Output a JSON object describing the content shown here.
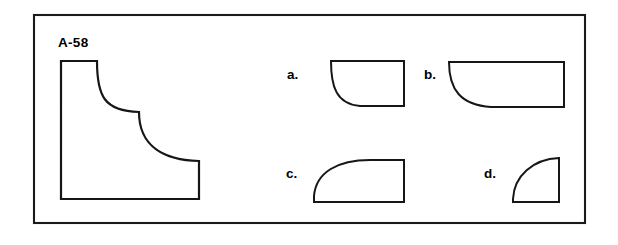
{
  "figure": {
    "id_label": "A-58",
    "frame": {
      "x": 34,
      "y": 15,
      "width": 551,
      "height": 208,
      "stroke_color": "#1a1a1a",
      "fill_color": "#ffffff"
    },
    "background_color": "#ffffff",
    "line_color": "#161616"
  },
  "main_shape": {
    "name": "stepped-concave-profile",
    "description": "Two-step profile with two concave quarter-arcs descending left to right",
    "bounds": {
      "x": 60,
      "y": 60,
      "width": 140,
      "height": 140
    },
    "path": "M 61 61 L 97 61 C 97 96 104 111 139 112 L 139 112 L 139 112 C 139 147 165 160 199 161 L 199 199 L 61 199 Z"
  },
  "options": [
    {
      "key": "a",
      "label": "a.",
      "label_x": 287,
      "label_y": 79,
      "shape_name": "option-a-concave-lower-left",
      "bounds": {
        "x": 331,
        "y": 61,
        "width": 74,
        "height": 46
      },
      "path": "M 331 61 L 404 61 L 404 106 L 360 106 C 336 104 331 86 331 61 Z"
    },
    {
      "key": "b",
      "label": "b.",
      "label_x": 424,
      "label_y": 79,
      "shape_name": "option-b-wide-concave-lower-left",
      "bounds": {
        "x": 449,
        "y": 62,
        "width": 116,
        "height": 46
      },
      "path": "M 449 62 L 564 62 L 564 107 L 491 107 C 461 105 449 90 449 62 Z"
    },
    {
      "key": "c",
      "label": "c.",
      "label_x": 286,
      "label_y": 178,
      "shape_name": "option-c-convex-upper-left",
      "bounds": {
        "x": 314,
        "y": 160,
        "width": 91,
        "height": 43
      },
      "path": "M 404 160 L 404 202 L 314 202 L 314 196 C 316 172 338 160 370 160 Z"
    },
    {
      "key": "d",
      "label": "d.",
      "label_x": 484,
      "label_y": 178,
      "shape_name": "option-d-quarter-circle",
      "bounds": {
        "x": 513,
        "y": 158,
        "width": 47,
        "height": 45
      },
      "path": "M 559 158 L 559 202 L 513 202 L 513 199 C 514 176 533 159 559 158 Z"
    }
  ]
}
